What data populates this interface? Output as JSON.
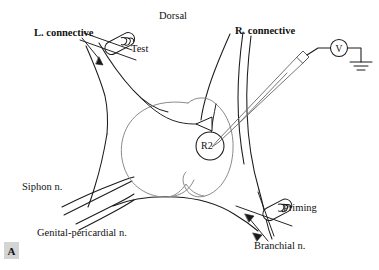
{
  "figure": {
    "panel_label": "A",
    "domain_description": "Aplysia abdominal ganglion preparation schematic",
    "background_color": "#ffffff",
    "line_color_outer": "#1a1a1a",
    "line_color_inner": "#7a7a7a",
    "panel_label_bg": "#d4d4d4"
  },
  "orientation": {
    "dorsal_label": "Dorsal"
  },
  "nerves": [
    {
      "id": "left-connective",
      "label": "L. connective"
    },
    {
      "id": "right-connective",
      "label": "R. connective"
    },
    {
      "id": "siphon-nerve",
      "label": "Siphon n."
    },
    {
      "id": "genital-pericardial-nerve",
      "label": "Genital-pericardial n."
    },
    {
      "id": "branchial-nerve",
      "label": "Branchial n."
    }
  ],
  "electrodes": [
    {
      "id": "test-electrode",
      "label": "Test",
      "type": "suction-cuff-electrode",
      "target": "left-connective"
    },
    {
      "id": "priming-electrode",
      "label": "Priming",
      "type": "suction-cuff-electrode",
      "target": "branchial-nerve"
    },
    {
      "id": "recording-microelectrode",
      "label": "",
      "type": "intracellular-micropipette",
      "target": "R2"
    }
  ],
  "cells": [
    {
      "id": "r2-neuron",
      "label": "R2"
    }
  ],
  "instruments": {
    "voltmeter": {
      "label": "V",
      "name": "voltmeter"
    },
    "ground": {
      "name": "ground-symbol"
    }
  },
  "markers": {
    "arrowhead": {
      "name": "pointer-arrowhead",
      "points_to": "R2"
    }
  }
}
